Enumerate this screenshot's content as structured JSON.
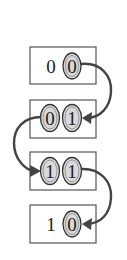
{
  "diagram": {
    "states": [
      {
        "bits": [
          "0",
          "0"
        ],
        "highlighted": [
          false,
          true
        ]
      },
      {
        "bits": [
          "0",
          "1"
        ],
        "highlighted": [
          true,
          true
        ]
      },
      {
        "bits": [
          "1",
          "1"
        ],
        "highlighted": [
          true,
          true
        ]
      },
      {
        "bits": [
          "1",
          "0"
        ],
        "highlighted": [
          false,
          true
        ]
      }
    ],
    "transitions": [
      {
        "from": 0,
        "to": 1,
        "side": "right"
      },
      {
        "from": 1,
        "to": 2,
        "side": "left"
      },
      {
        "from": 2,
        "to": 3,
        "side": "right"
      }
    ],
    "colors": {
      "ellipse_fill": "#d9d9d9",
      "stroke": "#444444",
      "box_stroke": "#555555"
    }
  }
}
